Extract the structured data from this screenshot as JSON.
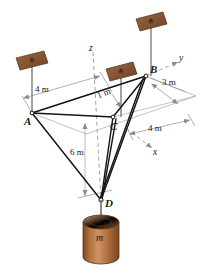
{
  "figure": {
    "type": "engineering-statics-diagram",
    "background_color": "#ffffff"
  },
  "points": {
    "A": {
      "label": "A",
      "x": 32,
      "y": 113
    },
    "B": {
      "label": "B",
      "x": 146,
      "y": 76
    },
    "C": {
      "label": "C",
      "x": 113,
      "y": 117
    },
    "D": {
      "label": "D",
      "x": 101,
      "y": 200
    }
  },
  "axes": {
    "z": {
      "label": "z",
      "x": 91,
      "y": 48
    },
    "y": {
      "label": "y",
      "x": 180,
      "y": 58
    },
    "x": {
      "label": "x",
      "x": 155,
      "y": 152
    }
  },
  "dimensions": [
    {
      "id": "dim-4m-left",
      "label": "4 m",
      "x": 37,
      "y": 89
    },
    {
      "id": "dim-1m",
      "label": "1 m",
      "x": 103,
      "y": 94
    },
    {
      "id": "dim-3m",
      "label": "3 m",
      "x": 168,
      "y": 83
    },
    {
      "id": "dim-4m-right",
      "label": "4 m",
      "x": 155,
      "y": 128
    },
    {
      "id": "dim-6m",
      "label": "6 m",
      "x": 75,
      "y": 152
    }
  ],
  "mass": {
    "label": "m",
    "label_x": 100,
    "label_y": 238,
    "body_color": "#b5713f",
    "shade_color": "#8d4f28",
    "top_color": "#cf9266"
  },
  "anchors": [
    {
      "id": "anchor-left",
      "plate_x": 30,
      "plate_y": 57,
      "rod_bottom_y": 113
    },
    {
      "id": "anchor-middle",
      "plate_x": 119,
      "plate_y": 68,
      "rod_bottom_y": 117
    },
    {
      "id": "anchor-right",
      "plate_x": 149,
      "plate_y": 18,
      "rod_bottom_y": 76
    }
  ],
  "colors": {
    "cable": "#1c1c1c",
    "construction_line": "#9a9a9a",
    "dashed_axis": "#9a9a9a",
    "rod": "#8d8d8d",
    "plate_face": "#8a5a38",
    "plate_edge": "#5e3a21"
  }
}
